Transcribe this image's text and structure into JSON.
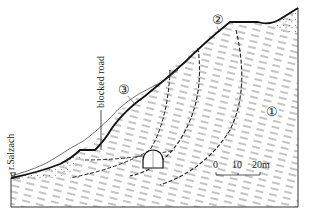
{
  "diagram": {
    "type": "geological-cross-section",
    "labels": {
      "river": "r.Salzach",
      "road": "blocked road",
      "marker_1": "①",
      "marker_2": "②",
      "marker_3": "③",
      "water_symbol": "∇"
    },
    "scale_bar": {
      "ticks": [
        "0",
        "10",
        "20m"
      ]
    },
    "colors": {
      "line": "#1a1a1a",
      "hatch": "#555555",
      "background": "#ffffff"
    }
  }
}
